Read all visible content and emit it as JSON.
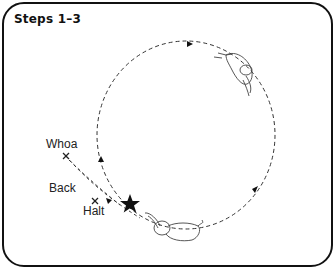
{
  "title": "Steps 1–3",
  "labels": {
    "whoa": "Whoa",
    "back": "Back",
    "halt": "Halt"
  },
  "markers": {
    "start": "star-icon",
    "stops": [
      "x-mark-whoa",
      "x-mark-halt"
    ]
  },
  "colors": {
    "stroke": "#111111",
    "line": "#333333"
  }
}
